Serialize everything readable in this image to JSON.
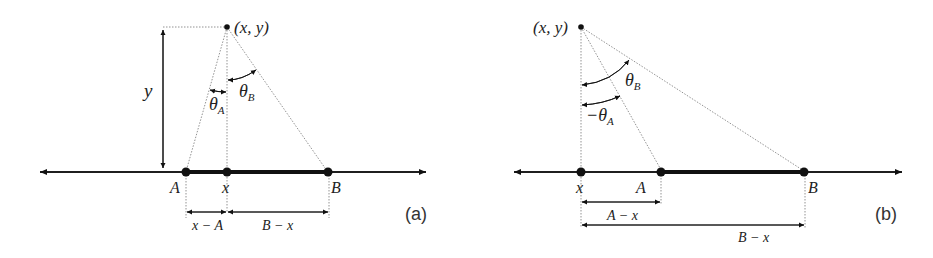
{
  "panels": [
    {
      "id": "a",
      "label": "(a)",
      "point_label": "(x, y)",
      "height_label": "y",
      "angle_a_label": "θ",
      "angle_a_sub": "A",
      "angle_b_label": "θ",
      "angle_b_sub": "B",
      "axis_points": [
        "A",
        "x",
        "B"
      ],
      "dim_labels": [
        "x − A",
        "B − x"
      ]
    },
    {
      "id": "b",
      "label": "(b)",
      "point_label": "(x, y)",
      "angle_a_label": "−θ",
      "angle_a_sub": "A",
      "angle_b_label": "θ",
      "angle_b_sub": "B",
      "axis_points": [
        "x",
        "A",
        "B"
      ],
      "dim_labels": [
        "A − x",
        "B − x"
      ]
    }
  ],
  "colors": {
    "line": "#111111",
    "dotted": "#777777",
    "text": "#222222"
  }
}
